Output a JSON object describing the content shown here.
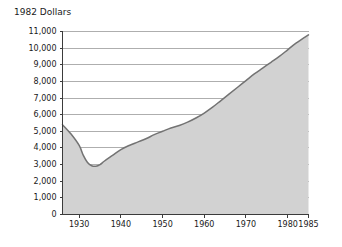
{
  "chart_data": {
    "type": "area",
    "title": "1982 Dollars",
    "xlabel": "",
    "ylabel": "",
    "grid": true,
    "legend": false,
    "xlim": [
      1926,
      1985
    ],
    "ylim": [
      0,
      11000
    ],
    "y_ticks": [
      0,
      1000,
      2000,
      3000,
      4000,
      5000,
      6000,
      7000,
      8000,
      9000,
      10000,
      11000
    ],
    "y_tick_labels": [
      "0",
      "1,000",
      "2,000",
      "3,000",
      "4,000",
      "5,000",
      "6,000",
      "7,000",
      "8,000",
      "9,000",
      "10,000",
      "11,000"
    ],
    "x_ticks": [
      1930,
      1940,
      1950,
      1960,
      1970,
      1980,
      1985
    ],
    "x_tick_labels": [
      "1930",
      "1940",
      "1950",
      "1960",
      "1970",
      "1980",
      "1985"
    ],
    "series": [
      {
        "name": "1982 Dollars",
        "fill_color": "#d2d2d2",
        "line_color": "#737373",
        "x": [
          1926,
          1928,
          1930,
          1931,
          1932,
          1933,
          1934,
          1935,
          1936,
          1938,
          1940,
          1942,
          1944,
          1946,
          1948,
          1950,
          1952,
          1954,
          1956,
          1958,
          1960,
          1962,
          1964,
          1966,
          1968,
          1970,
          1972,
          1974,
          1976,
          1978,
          1980,
          1982,
          1985
        ],
        "values": [
          5400,
          4850,
          4150,
          3550,
          3120,
          2930,
          2900,
          3000,
          3200,
          3550,
          3900,
          4150,
          4350,
          4550,
          4800,
          5000,
          5200,
          5350,
          5550,
          5800,
          6100,
          6450,
          6850,
          7250,
          7650,
          8050,
          8450,
          8800,
          9150,
          9500,
          9900,
          10300,
          10800
        ]
      }
    ]
  },
  "colors": {
    "area_fill": "#d2d2d2",
    "area_line": "#737373",
    "gridline": "#8c8c8c",
    "axis": "#3b3b3b",
    "text": "#1a1a1a",
    "background": "#ffffff"
  }
}
